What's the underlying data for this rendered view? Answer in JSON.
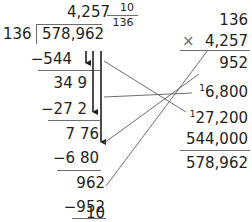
{
  "long_division": {
    "quotient": "4,257",
    "remainder_fraction": {
      "numerator": "10",
      "denominator": "136"
    },
    "divisor": "136",
    "dividend": "578,962",
    "steps": [
      {
        "subtract": "−544",
        "result": "34 9"
      },
      {
        "subtract": "−27 2",
        "result": "7 76"
      },
      {
        "subtract": "−6 80",
        "result": "962"
      },
      {
        "subtract": "−952",
        "result": "10"
      }
    ]
  },
  "multiplication_check": {
    "multiplicand": "136",
    "operator": "×",
    "multiplier": "4,257",
    "partial_products": [
      {
        "carry": "",
        "value": "952"
      },
      {
        "carry": "1",
        "value": "6,800"
      },
      {
        "carry": "1",
        "value": "27,200"
      },
      {
        "carry": "",
        "value": "544,000"
      }
    ],
    "product": "578,962"
  },
  "colors": {
    "text": "#231f20",
    "lines": "#6d6e71",
    "arrows": "#231f20"
  }
}
